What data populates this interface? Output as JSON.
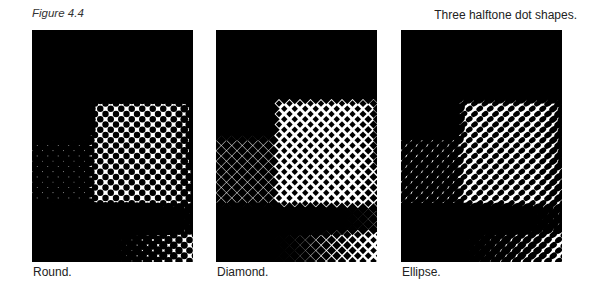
{
  "figure": {
    "number_label": "Figure 4.4",
    "caption": "Three halftone dot shapes."
  },
  "panels": [
    {
      "id": "round",
      "label": "Round.",
      "dot_shape": "circle"
    },
    {
      "id": "diamond",
      "label": "Diamond.",
      "dot_shape": "diamond"
    },
    {
      "id": "ellipse",
      "label": "Ellipse.",
      "dot_shape": "ellipse"
    }
  ],
  "colors": {
    "ink": "#000000",
    "paper": "#ffffff"
  },
  "halftone": {
    "cell_size": 10.5,
    "rotation_deg": 45
  }
}
